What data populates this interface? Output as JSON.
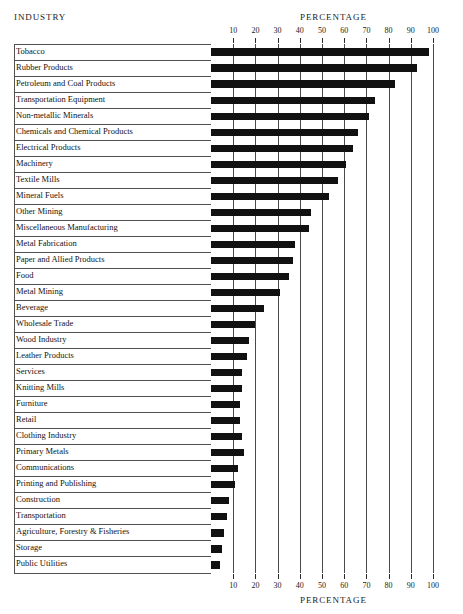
{
  "header": {
    "left_title": "INDUSTRY",
    "right_title": "PERCENTAGE",
    "bottom_title": "PERCENTAGE"
  },
  "chart_data": {
    "type": "bar",
    "orientation": "horizontal",
    "title": "",
    "xlabel": "PERCENTAGE",
    "ylabel": "INDUSTRY",
    "xlim": [
      0,
      100
    ],
    "xticks": [
      10,
      20,
      30,
      40,
      50,
      60,
      70,
      80,
      90,
      100
    ],
    "grid": true,
    "legend": "none",
    "bar_color": "#111111",
    "categories": [
      "Tobacco",
      "Rubber Products",
      "Petroleum and Coal Products",
      "Transportation Equipment",
      "Non-metallic Minerals",
      "Chemicals and Chemical Products",
      "Electrical Products",
      "Machinery",
      "Textile Mills",
      "Mineral Fuels",
      "Other Mining",
      "Miscellaneous Manufacturing",
      "Metal Fabrication",
      "Paper and Allied Products",
      "Food",
      "Metal Mining",
      "Beverage",
      "Wholesale Trade",
      "Wood Industry",
      "Leather Products",
      "Services",
      "Knitting Mills",
      "Furniture",
      "Retail",
      "Clothing Industry",
      "Primary Metals",
      "Communications",
      "Printing and Publishing",
      "Construction",
      "Transportation",
      "Agriculture, Forestry & Fisheries",
      "Storage",
      "Public Utilities"
    ],
    "values": [
      98,
      93,
      83,
      74,
      71,
      66,
      64,
      61,
      57,
      53,
      45,
      44,
      38,
      37,
      35,
      31,
      24,
      20,
      17,
      16,
      14,
      14,
      13,
      13,
      14,
      15,
      12,
      11,
      8,
      7,
      6,
      5,
      4
    ]
  }
}
